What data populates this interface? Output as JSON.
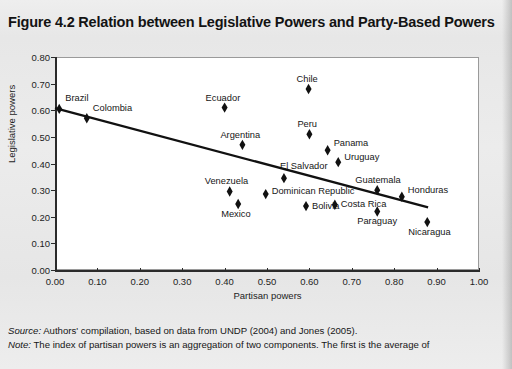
{
  "figure": {
    "title": "Figure 4.2 Relation between Legislative Powers and Party-Based Powers"
  },
  "footer": {
    "source_label": "Source:",
    "source_text": " Authors' compilation, based on data from UNDP (2004) and Jones (2005).",
    "note_label": "Note:",
    "note_text": " The index of partisan powers is an aggregation of two components. The first is the average of"
  },
  "chart_data": {
    "type": "scatter",
    "title": "Figure 4.2 Relation between Legislative Powers and Party-Based Powers",
    "xlabel": "Partisan powers",
    "ylabel": "Legislative powers",
    "xlim": [
      0.0,
      1.0
    ],
    "ylim": [
      0.0,
      0.8
    ],
    "xticks": [
      "0.00",
      "0.10",
      "0.20",
      "0.30",
      "0.40",
      "0.50",
      "0.60",
      "0.70",
      "0.80",
      "0.90",
      "1.00"
    ],
    "xtick_values": [
      0.0,
      0.1,
      0.2,
      0.3,
      0.4,
      0.5,
      0.6,
      0.7,
      0.8,
      0.9,
      1.0
    ],
    "yticks": [
      "0.00",
      "0.10",
      "0.20",
      "0.30",
      "0.40",
      "0.50",
      "0.60",
      "0.70",
      "0.80"
    ],
    "ytick_values": [
      0.0,
      0.1,
      0.2,
      0.3,
      0.4,
      0.5,
      0.6,
      0.7,
      0.8
    ],
    "grid": false,
    "legend": "none",
    "marker": "diamond",
    "marker_color": "#111111",
    "points": [
      {
        "label": "Brazil",
        "x": 0.01,
        "y": 0.605,
        "label_dx": 6,
        "label_dy": -15
      },
      {
        "label": "Colombia",
        "x": 0.075,
        "y": 0.57,
        "label_dx": 6,
        "label_dy": -14
      },
      {
        "label": "Ecuador",
        "x": 0.4,
        "y": 0.61,
        "label_dx": -19,
        "label_dy": -14
      },
      {
        "label": "Chile",
        "x": 0.598,
        "y": 0.68,
        "label_dx": -12,
        "label_dy": -14
      },
      {
        "label": "Argentina",
        "x": 0.442,
        "y": 0.47,
        "label_dx": -22,
        "label_dy": -14
      },
      {
        "label": "Peru",
        "x": 0.6,
        "y": 0.51,
        "label_dx": -12,
        "label_dy": -14
      },
      {
        "label": "Panama",
        "x": 0.643,
        "y": 0.45,
        "label_dx": 6,
        "label_dy": -11
      },
      {
        "label": "Uruguay",
        "x": 0.668,
        "y": 0.405,
        "label_dx": 6,
        "label_dy": -9
      },
      {
        "label": "Venezuela",
        "x": 0.412,
        "y": 0.295,
        "label_dx": -25,
        "label_dy": -14
      },
      {
        "label": "Mexico",
        "x": 0.432,
        "y": 0.248,
        "label_dx": -17,
        "label_dy": 6
      },
      {
        "label": "El Salvador",
        "x": 0.54,
        "y": 0.345,
        "label_dx": -4,
        "label_dy": -16
      },
      {
        "label": "Dominican Republic",
        "x": 0.497,
        "y": 0.285,
        "label_dx": 6,
        "label_dy": -7
      },
      {
        "label": "Bolivia",
        "x": 0.592,
        "y": 0.24,
        "label_dx": 6,
        "label_dy": -4
      },
      {
        "label": "Costa Rica",
        "x": 0.66,
        "y": 0.245,
        "label_dx": 6,
        "label_dy": -5
      },
      {
        "label": "Guatemala",
        "x": 0.76,
        "y": 0.3,
        "label_dx": -22,
        "label_dy": -14
      },
      {
        "label": "Honduras",
        "x": 0.818,
        "y": 0.275,
        "label_dx": 6,
        "label_dy": -11
      },
      {
        "label": "Paraguay",
        "x": 0.76,
        "y": 0.22,
        "label_dx": -20,
        "label_dy": 6
      },
      {
        "label": "Nicaragua",
        "x": 0.878,
        "y": 0.18,
        "label_dx": -19,
        "label_dy": 6
      }
    ],
    "trendline": {
      "type": "line",
      "color": "#111111",
      "x0": 0.0,
      "y0": 0.608,
      "x1": 0.88,
      "y1": 0.235
    }
  }
}
